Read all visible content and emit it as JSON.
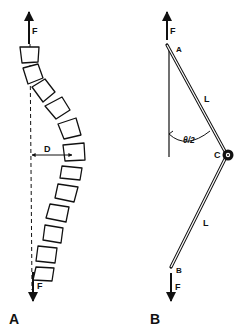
{
  "panels": {
    "a": {
      "label": "A",
      "force_top": "F",
      "force_bottom": "F",
      "deflection": "D",
      "vertebrae_count": 13
    },
    "b": {
      "label": "B",
      "force_top": "F",
      "force_bottom": "F",
      "point_top": "A",
      "point_hinge": "C",
      "point_bottom": "B",
      "segment_upper": "L",
      "segment_lower": "L",
      "angle": "θ/2"
    }
  },
  "colors": {
    "ink": "#111111",
    "background": "#ffffff"
  }
}
